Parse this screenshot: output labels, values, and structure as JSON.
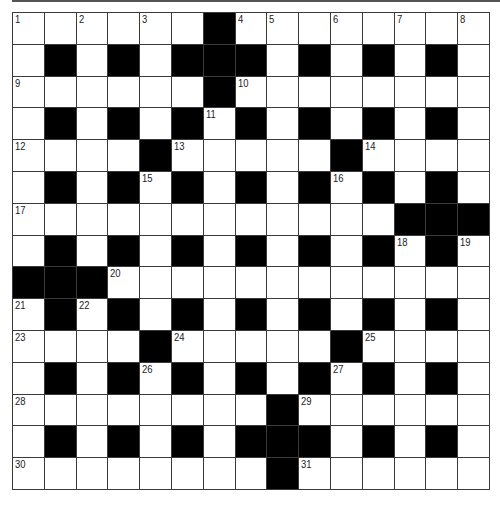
{
  "puzzle": {
    "rows": 15,
    "cols": 15,
    "colors": {
      "block": "#000000",
      "cell": "#ffffff",
      "grid_line": "#3a3a3a"
    },
    "layout": [
      "......#........",
      ".#.#.###.#.#.#.",
      "......#........",
      ".#.#.#.#.#.#.#.",
      "....#.....#....",
      ".#.#.#.#.#.#.#.",
      "............###",
      ".#.#.#.#.#.#.#.",
      "###............",
      ".#.#.#.#.#.#.#.",
      "....#.....#....",
      ".#.#.#.#.#.#.#.",
      "........#......",
      ".#.#.#.###.#.#.",
      "........#......"
    ],
    "numbers": [
      {
        "r": 0,
        "c": 0,
        "n": "1"
      },
      {
        "r": 0,
        "c": 2,
        "n": "2"
      },
      {
        "r": 0,
        "c": 4,
        "n": "3"
      },
      {
        "r": 0,
        "c": 7,
        "n": "4"
      },
      {
        "r": 0,
        "c": 8,
        "n": "5"
      },
      {
        "r": 0,
        "c": 10,
        "n": "6"
      },
      {
        "r": 0,
        "c": 12,
        "n": "7"
      },
      {
        "r": 0,
        "c": 14,
        "n": "8"
      },
      {
        "r": 2,
        "c": 0,
        "n": "9"
      },
      {
        "r": 2,
        "c": 7,
        "n": "10"
      },
      {
        "r": 3,
        "c": 6,
        "n": "11"
      },
      {
        "r": 4,
        "c": 0,
        "n": "12"
      },
      {
        "r": 4,
        "c": 5,
        "n": "13"
      },
      {
        "r": 4,
        "c": 11,
        "n": "14"
      },
      {
        "r": 5,
        "c": 4,
        "n": "15"
      },
      {
        "r": 5,
        "c": 10,
        "n": "16"
      },
      {
        "r": 6,
        "c": 0,
        "n": "17"
      },
      {
        "r": 7,
        "c": 12,
        "n": "18"
      },
      {
        "r": 7,
        "c": 14,
        "n": "19"
      },
      {
        "r": 8,
        "c": 3,
        "n": "20"
      },
      {
        "r": 9,
        "c": 0,
        "n": "21"
      },
      {
        "r": 9,
        "c": 2,
        "n": "22"
      },
      {
        "r": 10,
        "c": 0,
        "n": "23"
      },
      {
        "r": 10,
        "c": 5,
        "n": "24"
      },
      {
        "r": 10,
        "c": 11,
        "n": "25"
      },
      {
        "r": 11,
        "c": 4,
        "n": "26"
      },
      {
        "r": 11,
        "c": 10,
        "n": "27"
      },
      {
        "r": 12,
        "c": 0,
        "n": "28"
      },
      {
        "r": 12,
        "c": 9,
        "n": "29"
      },
      {
        "r": 14,
        "c": 0,
        "n": "30"
      },
      {
        "r": 14,
        "c": 9,
        "n": "31"
      }
    ]
  }
}
